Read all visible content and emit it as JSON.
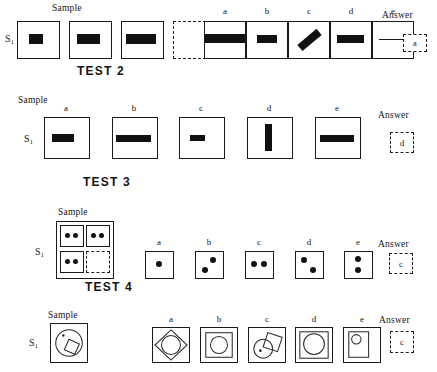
{
  "meta": {
    "sheet_type": "visual-analogy-test-sheet",
    "rows": 4
  },
  "labels": {
    "sample": "Sample",
    "answer": "Answer",
    "stimulus": "S",
    "stimulus_sub": "1",
    "option_letters": [
      "a",
      "b",
      "c",
      "d",
      "e"
    ]
  },
  "rows": [
    {
      "id": "row-1",
      "test_label": "TEST 2",
      "sample_caption": "Sample",
      "answer_caption": "Answer",
      "stimulus_label": "S",
      "stimulus_sub": "1",
      "answer_value": "a",
      "sample_items": [
        {
          "kind": "bar-h",
          "width_pct": 36,
          "height_pct": 26,
          "note": "narrow black bar"
        },
        {
          "kind": "bar-h",
          "width_pct": 56,
          "height_pct": 26,
          "note": "medium black bar"
        },
        {
          "kind": "bar-h",
          "width_pct": 74,
          "height_pct": 26,
          "note": "wide black bar"
        },
        {
          "kind": "empty-dashed",
          "note": "missing term"
        }
      ],
      "options": [
        {
          "letter": "a",
          "kind": "bar-h",
          "width_pct": 100,
          "height_pct": 26,
          "note": "bar spanning full width"
        },
        {
          "letter": "b",
          "kind": "bar-h",
          "width_pct": 50,
          "height_pct": 22,
          "note": "medium bar"
        },
        {
          "letter": "c",
          "kind": "bar-rot",
          "width_pct": 62,
          "height_pct": 22,
          "angle": -40,
          "note": "tilted bar"
        },
        {
          "letter": "d",
          "kind": "bar-h",
          "width_pct": 66,
          "height_pct": 22,
          "note": "wide bar"
        },
        {
          "letter": "e",
          "kind": "line-h",
          "width_pct": 72,
          "note": "thin horizontal line"
        }
      ]
    },
    {
      "id": "row-2",
      "test_label": "TEST 3",
      "sample_caption": "Sample",
      "answer_caption": "Answer",
      "stimulus_label": "S",
      "stimulus_sub": "1",
      "answer_value": "d",
      "sample_items": [],
      "options": [
        {
          "letter": "a",
          "kind": "bar-h",
          "width_pct": 50,
          "height_pct": 21,
          "note": "sample bar"
        },
        {
          "letter": "b",
          "kind": "bar-h",
          "width_pct": 80,
          "height_pct": 17,
          "note": "long thin bar"
        },
        {
          "letter": "c",
          "kind": "bar-h",
          "width_pct": 34,
          "height_pct": 15,
          "note": "short bar"
        },
        {
          "letter": "d",
          "kind": "bar-v",
          "width_pct": 17,
          "height_pct": 68,
          "note": "vertical bar"
        },
        {
          "letter": "e",
          "kind": "bar-h",
          "width_pct": 78,
          "height_pct": 16,
          "note": "long thin bar"
        }
      ]
    },
    {
      "id": "row-3",
      "test_label": "TEST 4",
      "sample_caption": "Sample",
      "answer_caption": "Answer",
      "stimulus_label": "S",
      "stimulus_sub": "1",
      "answer_value": "c",
      "matrix": {
        "cells": [
          {
            "kind": "dots",
            "pattern": "two-horizontal",
            "count": 2
          },
          {
            "kind": "dots",
            "pattern": "two-horizontal",
            "count": 2
          },
          {
            "kind": "dots",
            "pattern": "two-horizontal",
            "count": 2
          },
          {
            "kind": "empty-dashed",
            "pattern": "missing",
            "count": 0
          }
        ]
      },
      "options": [
        {
          "letter": "a",
          "kind": "dots",
          "pattern": "one-center",
          "count": 1
        },
        {
          "letter": "b",
          "kind": "dots",
          "pattern": "diagonal-up",
          "count": 2
        },
        {
          "letter": "c",
          "kind": "dots",
          "pattern": "two-horizontal",
          "count": 2
        },
        {
          "letter": "d",
          "kind": "dots",
          "pattern": "diagonal-down",
          "count": 2
        },
        {
          "letter": "e",
          "kind": "dots",
          "pattern": "two-vertical",
          "count": 2
        }
      ]
    },
    {
      "id": "row-4",
      "test_label": "",
      "sample_caption": "Sample",
      "answer_caption": "Answer",
      "stimulus_label": "S",
      "stimulus_sub": "1",
      "answer_value": "c",
      "sample_figure": {
        "kind": "circle-with-square-and-dot",
        "note": "large circle containing small tilted square plus a dot"
      },
      "options": [
        {
          "letter": "a",
          "kind": "square-diamond-circle",
          "note": "square with inscribed diamond and circle"
        },
        {
          "letter": "b",
          "kind": "square-in-square-circle",
          "note": "nested square containing circle"
        },
        {
          "letter": "c",
          "kind": "circle-square-overlap-dot",
          "note": "circle overlapping tilted square with dot"
        },
        {
          "letter": "d",
          "kind": "square-in-square-big-circle",
          "note": "nested square with large circle"
        },
        {
          "letter": "e",
          "kind": "rect-small-circle",
          "note": "tall rectangle with small circle at top"
        }
      ]
    }
  ],
  "colors": {
    "ink": "#141414",
    "fill": "#111111",
    "outline": "#1a1a1a",
    "paper": "#ffffff"
  }
}
